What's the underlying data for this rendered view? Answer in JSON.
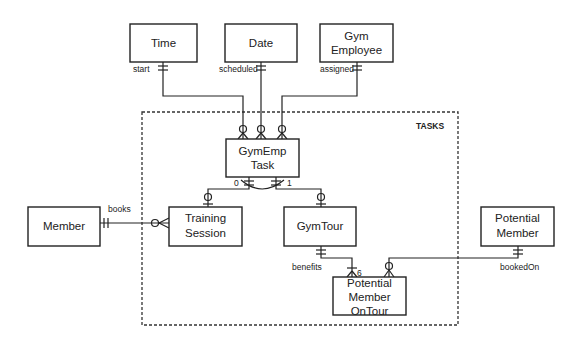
{
  "diagram": {
    "type": "entity-relationship",
    "group": {
      "label": "TASKS"
    },
    "entities": {
      "time": [
        "Time"
      ],
      "date": [
        "Date"
      ],
      "gym_employee": [
        "Gym",
        "Employee"
      ],
      "gymemp_task": [
        "GymEmp",
        "Task"
      ],
      "member": [
        "Member"
      ],
      "training_session": [
        "Training",
        "Session"
      ],
      "gym_tour": [
        "GymTour"
      ],
      "potential_member": [
        "Potential",
        "Member"
      ],
      "pm_on_tour": [
        "Potential",
        "Member",
        "OnTour"
      ]
    },
    "relationships": [
      {
        "from": "Time",
        "to": "GymEmp Task",
        "label": "start",
        "from_card": "one-and-only-one",
        "to_card": "zero-or-many"
      },
      {
        "from": "Date",
        "to": "GymEmp Task",
        "label": "scheduled",
        "from_card": "one-and-only-one",
        "to_card": "zero-or-many"
      },
      {
        "from": "Gym Employee",
        "to": "GymEmp Task",
        "label": "assigned",
        "from_card": "one-and-only-one",
        "to_card": "zero-or-many"
      },
      {
        "from": "GymEmp Task",
        "to": "Training Session",
        "label": "",
        "from_card": "one-and-only-one",
        "to_card": "zero-or-one"
      },
      {
        "from": "GymEmp Task",
        "to": "GymTour",
        "label": "",
        "from_card": "one-and-only-one",
        "to_card": "zero-or-one"
      },
      {
        "from": "Member",
        "to": "Training Session",
        "label": "books",
        "from_card": "one-and-only-one",
        "to_card": "zero-or-many"
      },
      {
        "from": "GymTour",
        "to": "Potential Member OnTour",
        "label": "benefits",
        "from_card": "one-and-only-one",
        "to_card": "one-to-many (max 6)"
      },
      {
        "from": "Potential Member",
        "to": "Potential Member OnTour",
        "label": "bookedOn",
        "from_card": "one-and-only-one",
        "to_card": "zero-or-many"
      }
    ],
    "labels": {
      "start": "start",
      "scheduled": "scheduled",
      "assigned": "assigned",
      "books": "books",
      "benefits": "benefits",
      "bookedOn": "bookedOn",
      "exclusive_left": "0",
      "exclusive_right": "1",
      "max_six": "6"
    }
  }
}
